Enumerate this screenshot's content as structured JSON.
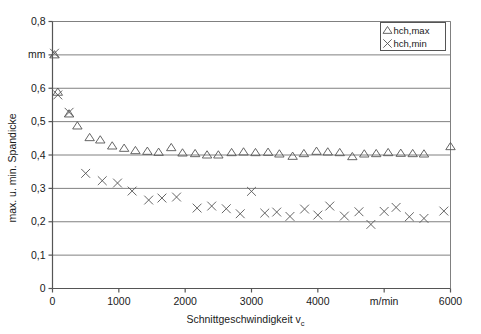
{
  "chart_data": {
    "type": "scatter",
    "title": "",
    "xlabel": "Schnittgeschwindigkeit v_c",
    "xlabel_main": "Schnittgeschwindigkeit v",
    "xlabel_sub": "c",
    "ylabel": "max. u. min. Spandicke",
    "yunit": "mm",
    "xunit": "m/min",
    "xlim": [
      0,
      6000
    ],
    "ylim": [
      0,
      0.8
    ],
    "grid": "horizontal",
    "legend_position": "top-right",
    "x_ticks": [
      {
        "value": 0,
        "label": "0"
      },
      {
        "value": 1000,
        "label": "1000"
      },
      {
        "value": 2000,
        "label": "2000"
      },
      {
        "value": 3000,
        "label": "3000"
      },
      {
        "value": 4000,
        "label": "4000"
      },
      {
        "value": 5000,
        "label": "m/min"
      },
      {
        "value": 6000,
        "label": "6000"
      }
    ],
    "y_ticks": [
      {
        "value": 0,
        "label": "0"
      },
      {
        "value": 0.1,
        "label": "0,1"
      },
      {
        "value": 0.2,
        "label": "0,2"
      },
      {
        "value": 0.3,
        "label": "0,3"
      },
      {
        "value": 0.4,
        "label": "0,4"
      },
      {
        "value": 0.5,
        "label": "0,5"
      },
      {
        "value": 0.6,
        "label": "0,6"
      },
      {
        "value": 0.7,
        "label": "mm"
      },
      {
        "value": 0.8,
        "label": "0,8"
      }
    ],
    "series": [
      {
        "name": "hch,max",
        "marker": "triangle",
        "color": "#555555",
        "points": [
          [
            30,
            0.7
          ],
          [
            80,
            0.588
          ],
          [
            250,
            0.523
          ],
          [
            375,
            0.487
          ],
          [
            560,
            0.452
          ],
          [
            720,
            0.445
          ],
          [
            900,
            0.427
          ],
          [
            1080,
            0.42
          ],
          [
            1250,
            0.413
          ],
          [
            1430,
            0.411
          ],
          [
            1600,
            0.408
          ],
          [
            1790,
            0.422
          ],
          [
            1960,
            0.406
          ],
          [
            2150,
            0.404
          ],
          [
            2330,
            0.4
          ],
          [
            2500,
            0.4
          ],
          [
            2700,
            0.407
          ],
          [
            2880,
            0.409
          ],
          [
            3060,
            0.407
          ],
          [
            3250,
            0.408
          ],
          [
            3420,
            0.403
          ],
          [
            3620,
            0.396
          ],
          [
            3790,
            0.404
          ],
          [
            3980,
            0.411
          ],
          [
            4150,
            0.409
          ],
          [
            4330,
            0.407
          ],
          [
            4520,
            0.395
          ],
          [
            4700,
            0.403
          ],
          [
            4880,
            0.404
          ],
          [
            5060,
            0.407
          ],
          [
            5250,
            0.405
          ],
          [
            5430,
            0.404
          ],
          [
            5600,
            0.403
          ],
          [
            6000,
            0.425
          ]
        ]
      },
      {
        "name": "hch,min",
        "marker": "cross",
        "color": "#555555",
        "points": [
          [
            30,
            0.705
          ],
          [
            80,
            0.58
          ],
          [
            250,
            0.528
          ],
          [
            500,
            0.345
          ],
          [
            750,
            0.323
          ],
          [
            980,
            0.316
          ],
          [
            1200,
            0.292
          ],
          [
            1450,
            0.265
          ],
          [
            1650,
            0.271
          ],
          [
            1870,
            0.274
          ],
          [
            2180,
            0.241
          ],
          [
            2400,
            0.247
          ],
          [
            2620,
            0.239
          ],
          [
            2830,
            0.224
          ],
          [
            3000,
            0.291
          ],
          [
            3200,
            0.226
          ],
          [
            3380,
            0.229
          ],
          [
            3580,
            0.216
          ],
          [
            3800,
            0.238
          ],
          [
            4000,
            0.22
          ],
          [
            4180,
            0.247
          ],
          [
            4400,
            0.217
          ],
          [
            4620,
            0.23
          ],
          [
            4800,
            0.192
          ],
          [
            5000,
            0.231
          ],
          [
            5180,
            0.243
          ],
          [
            5380,
            0.215
          ],
          [
            5600,
            0.21
          ],
          [
            5900,
            0.232
          ]
        ]
      }
    ]
  },
  "legend": {
    "entries": [
      {
        "label": "hch,max",
        "marker": "triangle"
      },
      {
        "label": "hch,min",
        "marker": "cross"
      }
    ]
  }
}
